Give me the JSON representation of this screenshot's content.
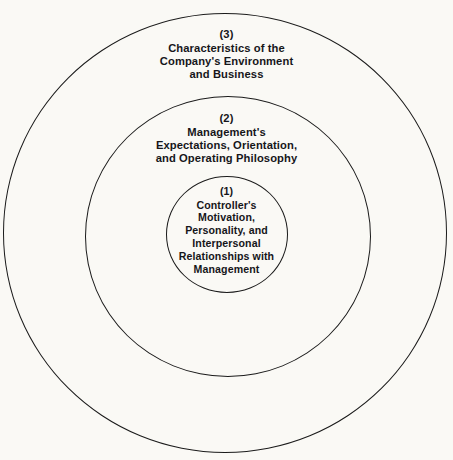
{
  "diagram": {
    "type": "concentric-circles",
    "background_color": "#faf9f5",
    "stroke_color": "#1b1b1b",
    "text_color": "#16161a",
    "rings": [
      {
        "id": "outer",
        "number": "(3)",
        "lines": [
          "Characteristics of the",
          "Company's Environment",
          "and Business"
        ]
      },
      {
        "id": "middle",
        "number": "(2)",
        "lines": [
          "Management's",
          "Expectations, Orientation,",
          "and Operating Philosophy"
        ]
      },
      {
        "id": "inner",
        "number": "(1)",
        "lines": [
          "Controller's",
          "Motivation,",
          "Personality, and",
          "Interpersonal",
          "Relationships with",
          "Management"
        ]
      }
    ]
  }
}
